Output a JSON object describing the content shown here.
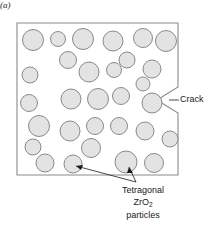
{
  "figure": {
    "panel_caption": "(a)",
    "matrix": {
      "name": "ceramic-matrix",
      "fill_color": "#ffffff",
      "stroke_color": "#8a8a8a"
    },
    "particle_style": {
      "fill_color": "#e3e3e3",
      "stroke_color": "#8a8a8a"
    },
    "annotations": {
      "crack": {
        "label": "Crack",
        "leader": {
          "x1": 178,
          "y1": 100,
          "x2": 179,
          "y2": 100
        }
      },
      "particles": {
        "line1": "Tetragonal",
        "line2_pre": "ZrO",
        "line2_sub": "2",
        "line3": "particles",
        "arrow_origin": {
          "x": 136,
          "y": 182
        },
        "arrow_targets": [
          {
            "x": 73,
            "y": 164
          },
          {
            "x": 128,
            "y": 165
          }
        ]
      }
    },
    "crack_notch": {
      "edge_x": 178,
      "top_y": 87,
      "apex_x": 157,
      "apex_y": 100,
      "bottom_y": 113
    },
    "boundary": {
      "left": 17,
      "top": 23,
      "right": 178,
      "bottom": 175
    },
    "particles": [
      {
        "cx": 33,
        "cy": 40,
        "r": 10.5
      },
      {
        "cx": 58,
        "cy": 39,
        "r": 7.5
      },
      {
        "cx": 83,
        "cy": 39,
        "r": 10.5
      },
      {
        "cx": 113,
        "cy": 41,
        "r": 10.0
      },
      {
        "cx": 143,
        "cy": 38,
        "r": 9.5
      },
      {
        "cx": 166,
        "cy": 41,
        "r": 10.5
      },
      {
        "cx": 68,
        "cy": 60,
        "r": 8.5
      },
      {
        "cx": 127,
        "cy": 60,
        "r": 8.0
      },
      {
        "cx": 30,
        "cy": 75,
        "r": 8.0
      },
      {
        "cx": 89,
        "cy": 72,
        "r": 10.0
      },
      {
        "cx": 114,
        "cy": 70,
        "r": 7.5
      },
      {
        "cx": 152,
        "cy": 69,
        "r": 9.0
      },
      {
        "cx": 143,
        "cy": 84,
        "r": 7.0
      },
      {
        "cx": 29,
        "cy": 103,
        "r": 8.5
      },
      {
        "cx": 71,
        "cy": 99,
        "r": 10.0
      },
      {
        "cx": 98,
        "cy": 99,
        "r": 10.5
      },
      {
        "cx": 121,
        "cy": 96,
        "r": 8.5
      },
      {
        "cx": 152,
        "cy": 103,
        "r": 10.0
      },
      {
        "cx": 39,
        "cy": 126,
        "r": 10.5
      },
      {
        "cx": 70,
        "cy": 131,
        "r": 10.0
      },
      {
        "cx": 95,
        "cy": 126,
        "r": 8.5
      },
      {
        "cx": 119,
        "cy": 126,
        "r": 8.5
      },
      {
        "cx": 145,
        "cy": 131,
        "r": 9.0
      },
      {
        "cx": 170,
        "cy": 139,
        "r": 8.0
      },
      {
        "cx": 33,
        "cy": 147,
        "r": 8.0
      },
      {
        "cx": 91,
        "cy": 148,
        "r": 9.5
      },
      {
        "cx": 45,
        "cy": 163,
        "r": 9.0
      },
      {
        "cx": 73,
        "cy": 164,
        "r": 9.0
      },
      {
        "cx": 126,
        "cy": 162,
        "r": 11.0
      },
      {
        "cx": 154,
        "cy": 163,
        "r": 9.5
      }
    ]
  }
}
